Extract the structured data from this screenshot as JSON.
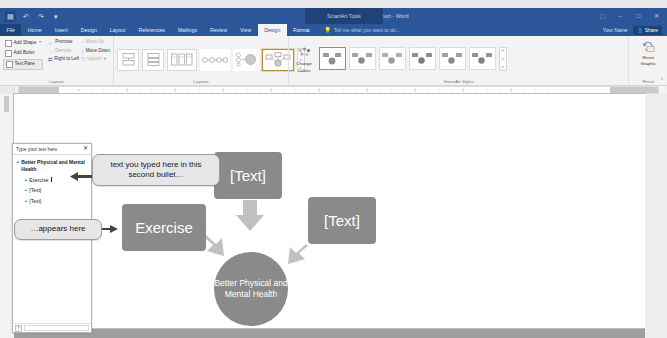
{
  "titlebar": {
    "doc_title": "New Casual Report - Word",
    "context_label": "SmartArt Tools",
    "quick_access": [
      {
        "name": "save-icon",
        "glyph": "▤"
      },
      {
        "name": "undo-icon",
        "glyph": "↶"
      },
      {
        "name": "redo-icon",
        "glyph": "↷"
      },
      {
        "name": "customize-qat-icon",
        "glyph": "▾"
      }
    ],
    "window_buttons": [
      {
        "name": "ribbon-display-options-icon",
        "glyph": "⬚"
      },
      {
        "name": "minimize-icon",
        "glyph": "–"
      },
      {
        "name": "restore-icon",
        "glyph": "□"
      },
      {
        "name": "close-icon",
        "glyph": "✕"
      }
    ]
  },
  "tabs": [
    {
      "label": "File",
      "state": "file"
    },
    {
      "label": "Home",
      "state": "normal"
    },
    {
      "label": "Insert",
      "state": "normal"
    },
    {
      "label": "Design",
      "state": "normal"
    },
    {
      "label": "Layout",
      "state": "normal"
    },
    {
      "label": "References",
      "state": "normal"
    },
    {
      "label": "Mailings",
      "state": "normal"
    },
    {
      "label": "Review",
      "state": "normal"
    },
    {
      "label": "View",
      "state": "normal"
    },
    {
      "label": "Design",
      "state": "active"
    },
    {
      "label": "Format",
      "state": "context"
    }
  ],
  "tellme": {
    "placeholder": "Tell me what you want to do...",
    "icon": "lightbulb-icon"
  },
  "account": {
    "user_name": "Your Name",
    "share_label": "Share",
    "share_icon": "person-share-icon"
  },
  "ribbon": {
    "groups": [
      {
        "name": "create-graphic",
        "label": "Create Graphic",
        "commands": [
          {
            "label": "Add Shape",
            "icon": "add-shape-icon",
            "dim": false,
            "caret": true
          },
          {
            "label": "Add Bullet",
            "icon": "add-bullet-icon",
            "dim": false,
            "caret": false
          },
          {
            "label": "Text Pane",
            "icon": "text-pane-icon",
            "dim": false,
            "caret": false,
            "pressed": true
          },
          {
            "label": "Promote",
            "icon": "promote-arrow-icon",
            "dim": false,
            "caret": false
          },
          {
            "label": "Demote",
            "icon": "demote-arrow-icon",
            "dim": true,
            "caret": false
          },
          {
            "label": "Right to Left",
            "icon": "right-to-left-icon",
            "dim": false,
            "caret": false
          },
          {
            "label": "Move Up",
            "icon": "move-up-icon",
            "dim": true,
            "caret": false
          },
          {
            "label": "Move Down",
            "icon": "move-down-icon",
            "dim": false,
            "caret": false
          },
          {
            "label": "Layout",
            "icon": "layout-icon",
            "dim": true,
            "caret": true
          }
        ]
      },
      {
        "name": "layouts",
        "label": "Layouts",
        "gallery_count": 6,
        "selected_index": 5,
        "scroll_icons": [
          "▴",
          "▾",
          "▾"
        ]
      },
      {
        "name": "smartart-styles",
        "label": "SmartArt Styles",
        "change_colors": {
          "label_line1": "Change",
          "label_line2": "Colors",
          "icon": "change-colors-icon"
        },
        "gallery_count": 6,
        "selected_index": 0,
        "scroll_icons": [
          "▴",
          "▾",
          "▾"
        ]
      },
      {
        "name": "reset",
        "label": "Reset",
        "reset_graphic": {
          "label_line1": "Reset",
          "label_line2": "Graphic",
          "icon": "reset-graphic-icon"
        }
      }
    ],
    "collapse_icon": "⌃"
  },
  "textpane": {
    "title": "Type your text here",
    "close_icon": "✕",
    "bullets": [
      {
        "text": "Better Physical and Mental Health",
        "level": 1,
        "caret": false
      },
      {
        "text": "Exercise",
        "level": 2,
        "caret": true
      },
      {
        "text": "[Text]",
        "level": 2,
        "caret": false
      },
      {
        "text": "[Text]",
        "level": 2,
        "caret": false
      }
    ],
    "footer_button": "?"
  },
  "smartart": {
    "nodes": [
      {
        "name": "node-text-top",
        "text": "[Text]"
      },
      {
        "name": "node-exercise",
        "text": "Exercise"
      },
      {
        "name": "node-text-right",
        "text": "[Text]"
      }
    ],
    "center": {
      "name": "node-center",
      "text": "Better Physical and Mental Health"
    },
    "shape_color": "#8a8a8a",
    "arrow_color": "#b9b9b9"
  },
  "callouts": [
    {
      "name": "callout-second-bullet",
      "text": "text you typed here in this second bullet…"
    },
    {
      "name": "callout-appears-here",
      "text": "…appears here"
    }
  ]
}
